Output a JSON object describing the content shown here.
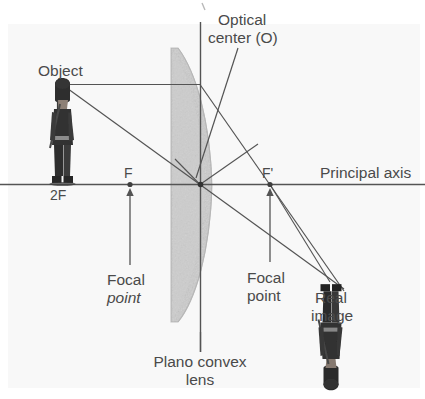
{
  "diagram": {
    "title_icons": {
      "lens_icon": "plano-convex-lens",
      "object_icon": "royal-guard-upright-figure",
      "image_icon": "royal-guard-inverted-figure"
    },
    "labels": {
      "optical_center_line1": "Optical",
      "optical_center_line2": "center (O)",
      "object": "Object",
      "two_f": "2F",
      "f_left": "F",
      "f_right": "F'",
      "principal_axis": "Principal axis",
      "focal_left_line1": "Focal",
      "focal_left_line2": "point",
      "focal_right_line1": "Focal",
      "focal_right_line2": "point",
      "real_image_line1": "Real",
      "real_image_line2": "image",
      "lens_line1": "Plano convex",
      "lens_line2": "lens"
    },
    "colors": {
      "background": "#ffffff",
      "panel": "#f7f7f7",
      "line": "#545454",
      "text": "#4a4a4a",
      "lens_fill": "#c9c9c9",
      "lens_edge": "#b0b0b0",
      "figure_dark": "#3b3b3b",
      "figure_mid": "#555555",
      "figure_face": "#9a8c80"
    },
    "geometry": {
      "optical_center": {
        "x": 200,
        "y": 184
      },
      "focal_point_left": {
        "x": 130,
        "y": 184
      },
      "focal_point_right": {
        "x": 270,
        "y": 184
      },
      "object_base": {
        "x": 62,
        "y": 184
      },
      "object_top": {
        "x": 62,
        "y": 84
      },
      "image_base": {
        "x": 331,
        "y": 184
      },
      "image_tip": {
        "x": 331,
        "y": 285
      },
      "principal_axis_y": 184,
      "lens_axis_x": 200,
      "lens_left_x": 169,
      "lens_right_max_x": 212,
      "lens_top_y": 48,
      "lens_bottom_y": 322
    }
  }
}
